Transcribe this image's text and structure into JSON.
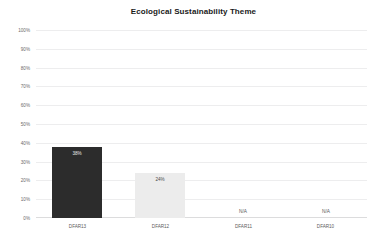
{
  "chart_data": {
    "type": "bar",
    "title": "Ecological Sustainability Theme",
    "xlabel": "",
    "ylabel": "",
    "categories": [
      "DFAR13",
      "DFAR12",
      "DFAR11",
      "DFAR10"
    ],
    "values": [
      38,
      24,
      null,
      null
    ],
    "value_labels": [
      "38%",
      "24%",
      "N/A",
      "N/A"
    ],
    "bar_colors": [
      "#2c2c2c",
      "#ececec",
      null,
      null
    ],
    "ylim": [
      0,
      100
    ],
    "y_ticks": [
      0,
      10,
      20,
      30,
      40,
      50,
      60,
      70,
      80,
      90,
      100
    ],
    "y_tick_labels": [
      "0%",
      "10%",
      "20%",
      "30%",
      "40%",
      "50%",
      "60%",
      "70%",
      "80%",
      "90%",
      "100%"
    ],
    "grid": true,
    "grid_axis": "y",
    "legend": false,
    "legend_position": "none",
    "grid_color": "#ededee",
    "axis_color": "#dcdcdd",
    "title_color": "#1a1a1a",
    "tick_label_color": "#5c5c5c"
  }
}
